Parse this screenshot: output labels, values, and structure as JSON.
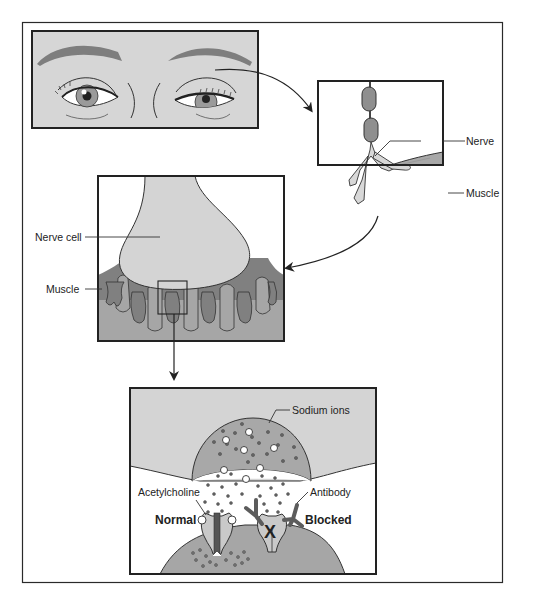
{
  "figure": {
    "colors": {
      "background": "#ffffff",
      "border": "#2a2a2a",
      "light_gray": "#d4d4d4",
      "mid_gray": "#a8a8a8",
      "dark_gray": "#7a7a7a",
      "nerve_segment": "#8f8f8f"
    },
    "panels": {
      "eyes": {
        "label": ""
      },
      "nerve_muscle": {
        "labels": {
          "nerve": "Nerve",
          "muscle": "Muscle"
        }
      },
      "junction": {
        "labels": {
          "nerve_cell": "Nerve cell",
          "muscle": "Muscle"
        }
      },
      "receptor": {
        "labels": {
          "sodium_ions": "Sodium ions",
          "acetylcholine": "Acetylcholine",
          "antibody": "Antibody",
          "normal": "Normal",
          "blocked": "Blocked"
        },
        "blocked_marker": "X"
      }
    }
  }
}
